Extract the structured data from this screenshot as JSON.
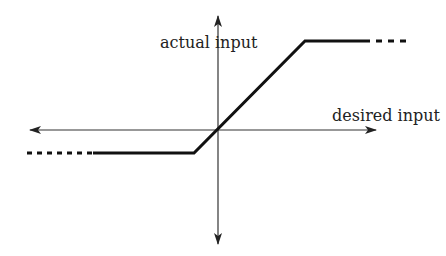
{
  "diagram": {
    "axes": {
      "x_label": "desired input",
      "y_label": "actual input"
    },
    "colors": {
      "axis": "#333333",
      "curve": "#111111",
      "text": "#222222",
      "background": "#ffffff"
    },
    "curve": {
      "description": "Saturation: linear through origin, flat plateaus at upper and lower limits, dashed continuation beyond",
      "segments": [
        {
          "type": "dashed",
          "from": "left extension",
          "level": "lower limit"
        },
        {
          "type": "solid",
          "level": "lower limit"
        },
        {
          "type": "solid",
          "slope": "linear through origin"
        },
        {
          "type": "solid",
          "level": "upper limit"
        },
        {
          "type": "dashed",
          "to": "right extension",
          "level": "upper limit"
        }
      ]
    }
  }
}
